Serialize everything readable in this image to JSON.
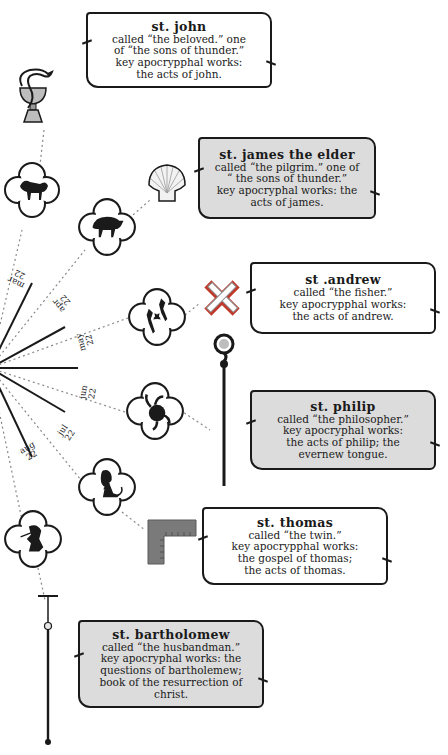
{
  "apostles": [
    {
      "name": "st. john",
      "lines": [
        "called “the beloved.” one",
        "of “the sons of thunder.”",
        "key apocrypphal works:",
        "the acts of john."
      ],
      "symbol": "chalice-with-serpent-icon",
      "zodiac": "aries-ram-icon",
      "style": "light"
    },
    {
      "name": "st. james the elder",
      "lines": [
        "called “the pilgrim.” one of",
        "“ the sons of thunder.”",
        "key apocryphal works: the",
        "acts of james."
      ],
      "symbol": "scallop-shell-icon",
      "zodiac": "taurus-bull-icon",
      "style": "grey"
    },
    {
      "name": "st .andrew",
      "lines": [
        "called “the fisher.”",
        "key apocrypphal works:",
        "the acts of andrew."
      ],
      "symbol": "saltire-cross-icon",
      "zodiac": "gemini-twins-icon",
      "style": "light"
    },
    {
      "name": "st. philip",
      "lines": [
        "called “the philosopher.”",
        "key apocryphal works:",
        "the acts of philip; the",
        "evernew tongue."
      ],
      "symbol": "staff-cross-icon",
      "zodiac": "cancer-crab-icon",
      "style": "grey"
    },
    {
      "name": "st. thomas",
      "lines": [
        "called “the twin.”",
        "key apocrypphal works:",
        "the gospel of thomas;",
        "the acts of thomas."
      ],
      "symbol": "carpenters-square-icon",
      "zodiac": "leo-lion-icon",
      "style": "light"
    },
    {
      "name": "st. bartholomew",
      "lines": [
        "called “the husbandman.”",
        "key apocryphal works: the",
        "questions of bartholemew;",
        "book of the resurrection of",
        "christ."
      ],
      "symbol": "flaying-knife-icon",
      "zodiac": "virgo-maiden-icon",
      "style": "grey"
    }
  ],
  "date_labels": [
    {
      "month": "mar",
      "day": "22"
    },
    {
      "month": "apr",
      "day": "22"
    },
    {
      "month": "may",
      "day": "22"
    },
    {
      "month": "jun",
      "day": "22"
    },
    {
      "month": "jul",
      "day": "22"
    },
    {
      "month": "aug",
      "day": "22"
    }
  ],
  "colors": {
    "ink": "#1a1a1a",
    "scroll_grey": "#dcdcdc",
    "symbol_grey": "#8a8a8a",
    "cross_red": "#c0392b",
    "line_dotted": "#888888"
  }
}
